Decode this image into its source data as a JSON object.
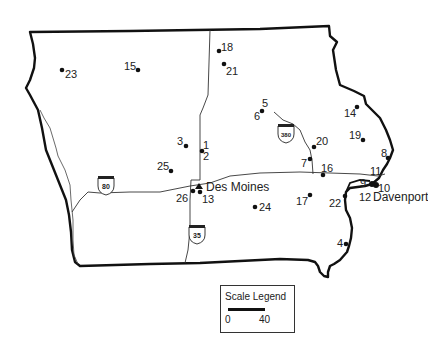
{
  "map": {
    "region": "Iowa",
    "cities": [
      {
        "name": "Des Moines"
      },
      {
        "name": "Davenport"
      }
    ],
    "interstates": [
      {
        "number": "80"
      },
      {
        "number": "35"
      },
      {
        "number": "380"
      }
    ],
    "sites": [
      {
        "id": "1",
        "label": "1"
      },
      {
        "id": "2",
        "label": "2"
      },
      {
        "id": "3",
        "label": "3"
      },
      {
        "id": "4",
        "label": "4"
      },
      {
        "id": "5",
        "label": "5"
      },
      {
        "id": "6",
        "label": "6"
      },
      {
        "id": "7",
        "label": "7"
      },
      {
        "id": "8",
        "label": "8"
      },
      {
        "id": "9",
        "label": "9"
      },
      {
        "id": "10",
        "label": "10"
      },
      {
        "id": "11",
        "label": "11"
      },
      {
        "id": "12",
        "label": "12"
      },
      {
        "id": "13",
        "label": "13"
      },
      {
        "id": "14",
        "label": "14"
      },
      {
        "id": "15",
        "label": "15"
      },
      {
        "id": "16",
        "label": "16"
      },
      {
        "id": "17",
        "label": "17"
      },
      {
        "id": "18",
        "label": "18"
      },
      {
        "id": "19",
        "label": "19"
      },
      {
        "id": "20",
        "label": "20"
      },
      {
        "id": "21",
        "label": "21"
      },
      {
        "id": "22",
        "label": "22"
      },
      {
        "id": "23",
        "label": "23"
      },
      {
        "id": "24",
        "label": "24"
      },
      {
        "id": "25",
        "label": "25"
      },
      {
        "id": "26",
        "label": "26"
      }
    ]
  },
  "legend": {
    "title": "Scale Legend",
    "min": "0",
    "max": "40"
  }
}
